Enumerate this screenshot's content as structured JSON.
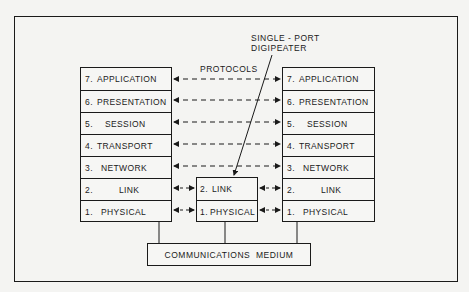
{
  "diagram": {
    "left_stack": [
      {
        "num": "7.",
        "name": "APPLICATION"
      },
      {
        "num": "6.",
        "name": "PRESENTATION"
      },
      {
        "num": "5.",
        "name": "SESSION"
      },
      {
        "num": "4.",
        "name": "TRANSPORT"
      },
      {
        "num": "3.",
        "name": "NETWORK"
      },
      {
        "num": "2.",
        "name": "LINK"
      },
      {
        "num": "1.",
        "name": "PHYSICAL"
      }
    ],
    "right_stack": [
      {
        "num": "7.",
        "name": "APPLICATION"
      },
      {
        "num": "6.",
        "name": "PRESENTATION"
      },
      {
        "num": "5.",
        "name": "SESSION"
      },
      {
        "num": "4.",
        "name": "TRANSPORT"
      },
      {
        "num": "3.",
        "name": "NETWORK"
      },
      {
        "num": "2.",
        "name": "LINK"
      },
      {
        "num": "1.",
        "name": "PHYSICAL"
      }
    ],
    "digipeater_stack": [
      {
        "num": "2.",
        "name": "LINK"
      },
      {
        "num": "1.",
        "name": "PHYSICAL"
      }
    ],
    "protocols_label": "PROTOCOLS",
    "digipeater_label_line1": "SINGLE - PORT",
    "digipeater_label_line2": "DIGIPEATER",
    "medium_label": "COMMUNICATIONS  MEDIUM"
  }
}
